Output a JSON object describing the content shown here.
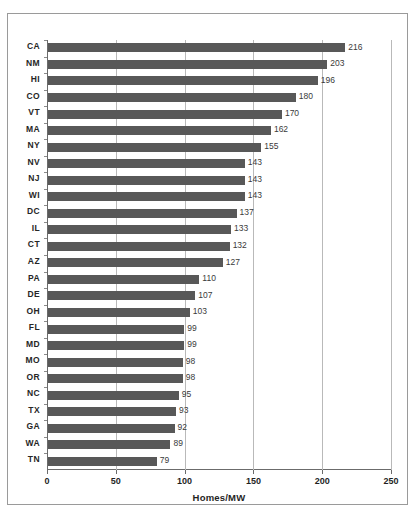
{
  "chart_data": {
    "type": "bar",
    "orientation": "horizontal",
    "title": "",
    "xlabel": "Homes/MW",
    "ylabel": "",
    "xlim": [
      0,
      250
    ],
    "xticks": [
      0,
      50,
      100,
      150,
      200,
      250
    ],
    "grid": true,
    "legend": null,
    "bar_color": "#585858",
    "categories": [
      "CA",
      "NM",
      "HI",
      "CO",
      "VT",
      "MA",
      "NY",
      "NV",
      "NJ",
      "WI",
      "DC",
      "IL",
      "CT",
      "AZ",
      "PA",
      "DE",
      "OH",
      "FL",
      "MD",
      "MO",
      "OR",
      "NC",
      "TX",
      "GA",
      "WA",
      "TN"
    ],
    "values": [
      216,
      203,
      196,
      180,
      170,
      162,
      155,
      143,
      143,
      143,
      137,
      133,
      132,
      127,
      110,
      107,
      103,
      99,
      99,
      98,
      98,
      95,
      93,
      92,
      89,
      79
    ],
    "data_labels": [
      "216",
      "203",
      "196",
      "180",
      "170",
      "162",
      "155",
      "143",
      "143",
      "143",
      "137",
      "133",
      "132",
      "127",
      "110",
      "107",
      "103",
      "99",
      "99",
      "98",
      "98",
      "95",
      "93",
      "92",
      "89",
      "79"
    ]
  }
}
